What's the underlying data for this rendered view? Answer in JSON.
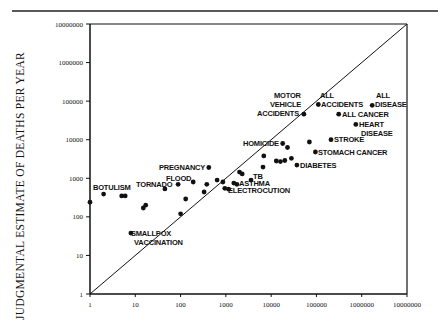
{
  "chart_data": {
    "type": "scatter",
    "title": "",
    "xlabel": "",
    "ylabel": "JUDGMENTAL ESTIMATE OF DEATHS PER YEAR",
    "xscale": "log",
    "yscale": "log",
    "xlim": [
      1,
      10000000
    ],
    "ylim": [
      1,
      10000000
    ],
    "x_ticks": [
      "1",
      "10",
      "100",
      "1000",
      "10000",
      "100000",
      "1000000",
      "10000000"
    ],
    "y_ticks": [
      "1",
      "10",
      "100",
      "1000",
      "10000",
      "100000",
      "1000000",
      "10000000"
    ],
    "grid": false,
    "legend": null,
    "reference_line": "y = x diagonal",
    "points": [
      {
        "x": 1,
        "y": 240,
        "label": ""
      },
      {
        "x": 2,
        "y": 390,
        "label": "BOTULISM"
      },
      {
        "x": 5,
        "y": 350,
        "label": ""
      },
      {
        "x": 6,
        "y": 350,
        "label": ""
      },
      {
        "x": 8,
        "y": 38,
        "label": "SMALLPOX VACCINATION"
      },
      {
        "x": 15,
        "y": 170,
        "label": ""
      },
      {
        "x": 17,
        "y": 200,
        "label": ""
      },
      {
        "x": 45,
        "y": 530,
        "label": "TORNADO"
      },
      {
        "x": 88,
        "y": 700,
        "label": ""
      },
      {
        "x": 100,
        "y": 120,
        "label": ""
      },
      {
        "x": 130,
        "y": 290,
        "label": ""
      },
      {
        "x": 190,
        "y": 800,
        "label": "FLOOD"
      },
      {
        "x": 330,
        "y": 440,
        "label": ""
      },
      {
        "x": 380,
        "y": 700,
        "label": ""
      },
      {
        "x": 420,
        "y": 1900,
        "label": "PREGNANCY"
      },
      {
        "x": 640,
        "y": 900,
        "label": ""
      },
      {
        "x": 860,
        "y": 800,
        "label": ""
      },
      {
        "x": 950,
        "y": 550,
        "label": ""
      },
      {
        "x": 1150,
        "y": 520,
        "label": "ELECTROCUTION"
      },
      {
        "x": 1500,
        "y": 750,
        "label": "ASTHMA"
      },
      {
        "x": 1750,
        "y": 700,
        "label": ""
      },
      {
        "x": 2000,
        "y": 1450,
        "label": ""
      },
      {
        "x": 2300,
        "y": 1300,
        "label": ""
      },
      {
        "x": 3600,
        "y": 900,
        "label": "TB"
      },
      {
        "x": 6600,
        "y": 1950,
        "label": ""
      },
      {
        "x": 6900,
        "y": 3800,
        "label": ""
      },
      {
        "x": 13000,
        "y": 2800,
        "label": ""
      },
      {
        "x": 16000,
        "y": 2700,
        "label": ""
      },
      {
        "x": 18000,
        "y": 8000,
        "label": "HOMICIDE"
      },
      {
        "x": 20000,
        "y": 2900,
        "label": ""
      },
      {
        "x": 23000,
        "y": 6300,
        "label": ""
      },
      {
        "x": 28000,
        "y": 3300,
        "label": ""
      },
      {
        "x": 37000,
        "y": 2200,
        "label": "DIABETES"
      },
      {
        "x": 53000,
        "y": 46000,
        "label": "MOTOR VEHICLE ACCIDENTS"
      },
      {
        "x": 70000,
        "y": 8700,
        "label": ""
      },
      {
        "x": 95000,
        "y": 4800,
        "label": "STOMACH CANCER"
      },
      {
        "x": 110000,
        "y": 82000,
        "label": "ALL ACCIDENTS"
      },
      {
        "x": 210000,
        "y": 10000,
        "label": "STROKE"
      },
      {
        "x": 310000,
        "y": 46000,
        "label": "ALL CANCER"
      },
      {
        "x": 740000,
        "y": 25000,
        "label": "HEART DISEASE"
      },
      {
        "x": 1700000,
        "y": 78000,
        "label": "ALL DISEASE"
      }
    ]
  },
  "labels": {
    "botulism": "BOTULISM",
    "tornado": "TORNADO",
    "flood": "FLOOD",
    "pregnancy": "PREGNANCY",
    "smallpox_1": "SMALLPOX",
    "smallpox_2": "VACCINATION",
    "tb": "TB",
    "asthma": "ASTHMA",
    "electrocution": "ELECTROCUTION",
    "homicide": "HOMICIDE",
    "diabetes": "DIABETES",
    "stomach_cancer": "STOMACH CANCER",
    "stroke": "STROKE",
    "heart_1": "HEART",
    "heart_2": "DISEASE",
    "all_cancer": "ALL CANCER",
    "motor_1": "MOTOR",
    "motor_2": "VEHICLE",
    "motor_3": "ACCIDENTS",
    "all_acc_1": "ALL",
    "all_acc_2": "ACCIDENTS",
    "all_dis_1": "ALL",
    "all_dis_2": "DISEASE"
  },
  "axis": {
    "ylabel": "JUDGMENTAL ESTIMATE OF DEATHS PER YEAR"
  }
}
